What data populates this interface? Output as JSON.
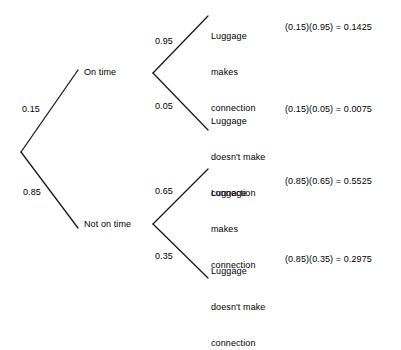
{
  "diagram": {
    "type": "probability-tree",
    "line_color": "#1a1a1a",
    "background_color": "#ffffff",
    "text_color": "#000000",
    "root": {
      "branches": [
        {
          "probability": "0.15",
          "label": "On time",
          "children": [
            {
              "probability": "0.95",
              "label_line1": "Luggage",
              "label_line2": "makes",
              "label_line3": "connection",
              "equation": "(0.15)(0.95) = 0.1425"
            },
            {
              "probability": "0.05",
              "label_line1": "Luggage",
              "label_line2": "doesn't make",
              "label_line3": "connection",
              "equation": "(0.15)(0.05) = 0.0075"
            }
          ]
        },
        {
          "probability": "0.85",
          "label": "Not on time",
          "children": [
            {
              "probability": "0.65",
              "label_line1": "Luggage",
              "label_line2": "makes",
              "label_line3": "connection",
              "equation": "(0.85)(0.65) = 0.5525"
            },
            {
              "probability": "0.35",
              "label_line1": "Luggage",
              "label_line2": "doesn't make",
              "label_line3": "connection",
              "equation": "(0.85)(0.35) = 0.2975"
            }
          ]
        }
      ]
    }
  }
}
